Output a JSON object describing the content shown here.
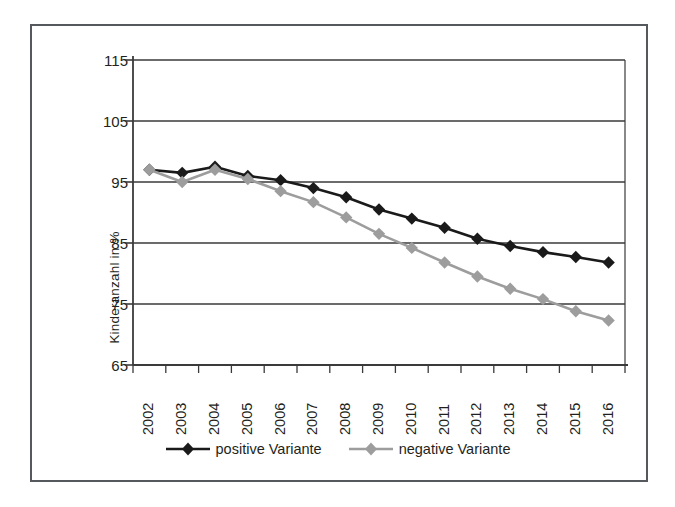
{
  "chart_data": {
    "type": "line",
    "title": "",
    "subtitle": "",
    "xlabel": "",
    "ylabel": "Kinderanzahl in %",
    "categories": [
      "2002",
      "2003",
      "2004",
      "2005",
      "2006",
      "2007",
      "2008",
      "2009",
      "2010",
      "2011",
      "2012",
      "2013",
      "2014",
      "2015",
      "2016"
    ],
    "x": [
      2002,
      2003,
      2004,
      2005,
      2006,
      2007,
      2008,
      2009,
      2010,
      2011,
      2012,
      2013,
      2014,
      2015,
      2016
    ],
    "ylim": [
      65,
      115
    ],
    "yticks": [
      65,
      75,
      85,
      95,
      105,
      115
    ],
    "grid": "horizontal",
    "legend_position": "bottom",
    "marker": "diamond",
    "series": [
      {
        "name": "positive Variante",
        "color": "#1a1a1a",
        "values": [
          97.0,
          96.5,
          97.5,
          96.0,
          95.3,
          94.0,
          92.5,
          90.5,
          89.0,
          87.5,
          85.7,
          84.5,
          83.5,
          82.7,
          81.8
        ]
      },
      {
        "name": "negative Variante",
        "color": "#9d9d9d",
        "values": [
          97.0,
          95.0,
          97.0,
          95.5,
          93.5,
          91.7,
          89.2,
          86.5,
          84.2,
          81.8,
          79.5,
          77.5,
          75.8,
          73.8,
          72.3
        ]
      }
    ]
  },
  "axis": {
    "y_labels": [
      "115",
      "105",
      "95",
      "85",
      "75",
      "65"
    ],
    "x_labels": [
      "2002",
      "2003",
      "2004",
      "2005",
      "2006",
      "2007",
      "2008",
      "2009",
      "2010",
      "2011",
      "2012",
      "2013",
      "2014",
      "2015",
      "2016"
    ],
    "y_title": "Kinderanzahl in %"
  },
  "legend": {
    "items": [
      {
        "label": "positive Variante",
        "color": "#1a1a1a",
        "marker": "diamond-marker"
      },
      {
        "label": "negative Variante",
        "color": "#9d9d9d",
        "marker": "diamond-marker"
      }
    ]
  },
  "style": {
    "frame_color": "#55585c",
    "axis_color": "#3a3a3a",
    "grid_color": "#3a3a3a",
    "background": "#ffffff",
    "positive_color": "#1a1a1a",
    "negative_color": "#9d9d9d"
  }
}
